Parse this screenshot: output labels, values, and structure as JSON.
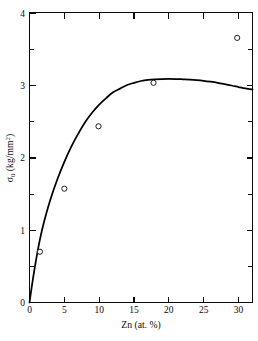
{
  "chart_data": {
    "type": "scatter",
    "title": "",
    "subtitle": "",
    "xlabel": "Zn (at. %)",
    "ylabel": "σ0 (kg/mm2)",
    "ylabel_parts": {
      "symbol": "σ",
      "subscript": "0",
      "units_open": " (kg/mm",
      "units_sup": "2",
      "units_close": ")"
    },
    "xlim": [
      0,
      32
    ],
    "ylim": [
      0,
      4
    ],
    "grid": false,
    "legend": null,
    "legend_position": "none",
    "x_ticks_major": [
      0,
      5,
      10,
      15,
      20,
      25,
      30
    ],
    "x_ticklabels": [
      "0",
      "5",
      "10",
      "15",
      "20",
      "25",
      "30"
    ],
    "y_ticks_major": [
      0,
      1,
      2,
      3,
      4
    ],
    "y_ticklabels": [
      "0",
      "1",
      "2",
      "3",
      "4"
    ],
    "y_ticks_minor": [
      0.5,
      1.5,
      2.5,
      3.5
    ],
    "marker": "open-circle",
    "marker_radius": 2.6,
    "points": [
      {
        "x": 1.5,
        "y": 0.7
      },
      {
        "x": 5.0,
        "y": 1.57
      },
      {
        "x": 9.9,
        "y": 2.43
      },
      {
        "x": 17.8,
        "y": 3.03
      },
      {
        "x": 29.8,
        "y": 3.65
      }
    ],
    "series": [
      {
        "name": "fit-curve",
        "kind": "line",
        "x": [
          0,
          0.5,
          1,
          1.5,
          2,
          3,
          4,
          5,
          6,
          7,
          8,
          9,
          10,
          11,
          12,
          13,
          14,
          15,
          16,
          17,
          18,
          19,
          20,
          21,
          22,
          23,
          24,
          25,
          26,
          27,
          28,
          29,
          30,
          31,
          32
        ],
        "values": [
          0.0,
          0.33,
          0.62,
          0.87,
          1.08,
          1.42,
          1.7,
          1.94,
          2.15,
          2.33,
          2.49,
          2.62,
          2.73,
          2.82,
          2.9,
          2.95,
          3.0,
          3.03,
          3.055,
          3.07,
          3.078,
          3.082,
          3.083,
          3.082,
          3.079,
          3.075,
          3.068,
          3.058,
          3.045,
          3.03,
          3.012,
          2.993,
          2.972,
          2.952,
          2.938
        ]
      }
    ],
    "curve_peak": {
      "x": 23,
      "y": 3.08
    },
    "colors": {
      "axis": "#0a0a0a",
      "curve": "#000000",
      "marker_stroke": "#111111",
      "marker_fill": "#ffffff",
      "background": "#ffffff"
    }
  }
}
